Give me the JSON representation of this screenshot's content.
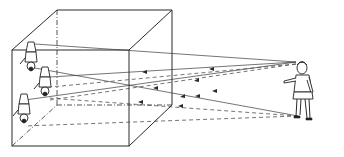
{
  "figure": {
    "elements": {
      "box": "box-with-pinhole",
      "viewer": "standing-person",
      "images": [
        "inverted-person-image-top",
        "inverted-person-image-middle",
        "inverted-person-image-bottom"
      ],
      "rays": {
        "solid_count": 3,
        "dashed_count": 3
      }
    },
    "colors": {
      "line": "#2a2a2a",
      "background": "#ffffff"
    }
  }
}
